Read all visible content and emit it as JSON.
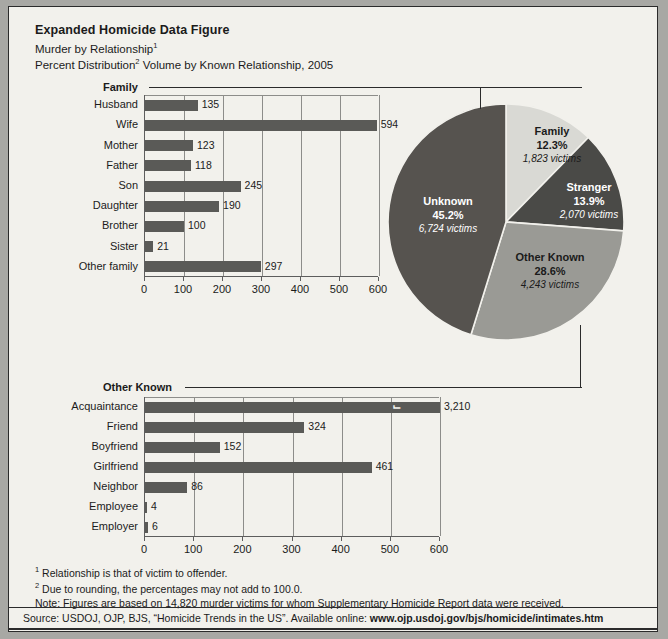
{
  "header": {
    "title": "Expanded Homicide Data Figure",
    "subtitle_1_text": "Murder by Relationship",
    "subtitle_1_sup": "1",
    "subtitle_2_pre": "Percent Distribution",
    "subtitle_2_sup": "2",
    "subtitle_2_post": " Volume by Known Relationship, 2005"
  },
  "colors": {
    "bar": "#5a5a57",
    "pie_family": "#d9d9d4",
    "pie_stranger": "#4a4a47",
    "pie_other_known": "#9a9a95",
    "pie_unknown": "#56534f",
    "background": "#f2f1ec",
    "ink": "#1b1b1b"
  },
  "chart_data": [
    {
      "type": "bar",
      "orientation": "horizontal",
      "title": "Family",
      "categories": [
        "Husband",
        "Wife",
        "Mother",
        "Father",
        "Son",
        "Daughter",
        "Brother",
        "Sister",
        "Other family"
      ],
      "values": [
        135,
        594,
        123,
        118,
        245,
        190,
        100,
        21,
        297
      ],
      "value_labels": [
        "135",
        "594",
        "123",
        "118",
        "245",
        "190",
        "100",
        "21",
        "297"
      ],
      "xlabel": "",
      "ylabel": "",
      "xlim": [
        0,
        600
      ],
      "ticks": [
        0,
        100,
        200,
        300,
        400,
        500,
        600
      ],
      "tick_labels": [
        "0",
        "100",
        "200",
        "300",
        "400",
        "500",
        "600"
      ],
      "grid": true,
      "legend": "none"
    },
    {
      "type": "bar",
      "orientation": "horizontal",
      "title": "Other Known",
      "categories": [
        "Acquaintance",
        "Friend",
        "Boyfriend",
        "Girlfriend",
        "Neighbor",
        "Employee",
        "Employer"
      ],
      "values": [
        3210,
        324,
        152,
        461,
        86,
        4,
        6
      ],
      "value_labels": [
        "3,210",
        "324",
        "152",
        "461",
        "86",
        "4",
        "6"
      ],
      "broken_axis_index": 0,
      "broken_axis_note": "Acquaintance bar is truncated with a break mark; actual value 3,210 exceeds axis maximum",
      "xlabel": "",
      "ylabel": "",
      "xlim": [
        0,
        600
      ],
      "ticks": [
        0,
        100,
        200,
        300,
        400,
        500,
        600
      ],
      "tick_labels": [
        "0",
        "100",
        "200",
        "300",
        "400",
        "500",
        "600"
      ],
      "grid": true,
      "legend": "none"
    },
    {
      "type": "pie",
      "title": "",
      "slices": [
        {
          "name": "Family",
          "percent": "12.3%",
          "value": 12.3,
          "victims": "1,823 victims",
          "color": "#d9d9d4",
          "text": "dark"
        },
        {
          "name": "Stranger",
          "percent": "13.9%",
          "value": 13.9,
          "victims": "2,070 victims",
          "color": "#4a4a47",
          "text": "light"
        },
        {
          "name": "Other Known",
          "percent": "28.6%",
          "value": 28.6,
          "victims": "4,243 victims",
          "color": "#9a9a95",
          "text": "dark"
        },
        {
          "name": "Unknown",
          "percent": "45.2%",
          "value": 45.2,
          "victims": "6,724 victims",
          "color": "#56534f",
          "text": "light"
        }
      ],
      "legend": "labels-on-slices"
    }
  ],
  "notes": {
    "note_1_sup": "1",
    "note_1": " Relationship is that of victim to offender.",
    "note_2_sup": "2",
    "note_2": " Due to rounding, the percentages may not add to 100.0.",
    "note_3": "Note: Figures are based on 14,820 murder victims for whom Supplementary Homicide Report data were received."
  },
  "source": {
    "prefix": "Source: USDOJ, OJP, BJS, “Homicide Trends in the US”. Available online: ",
    "url": "www.ojp.usdoj.gov/bjs/homicide/intimates.htm"
  }
}
